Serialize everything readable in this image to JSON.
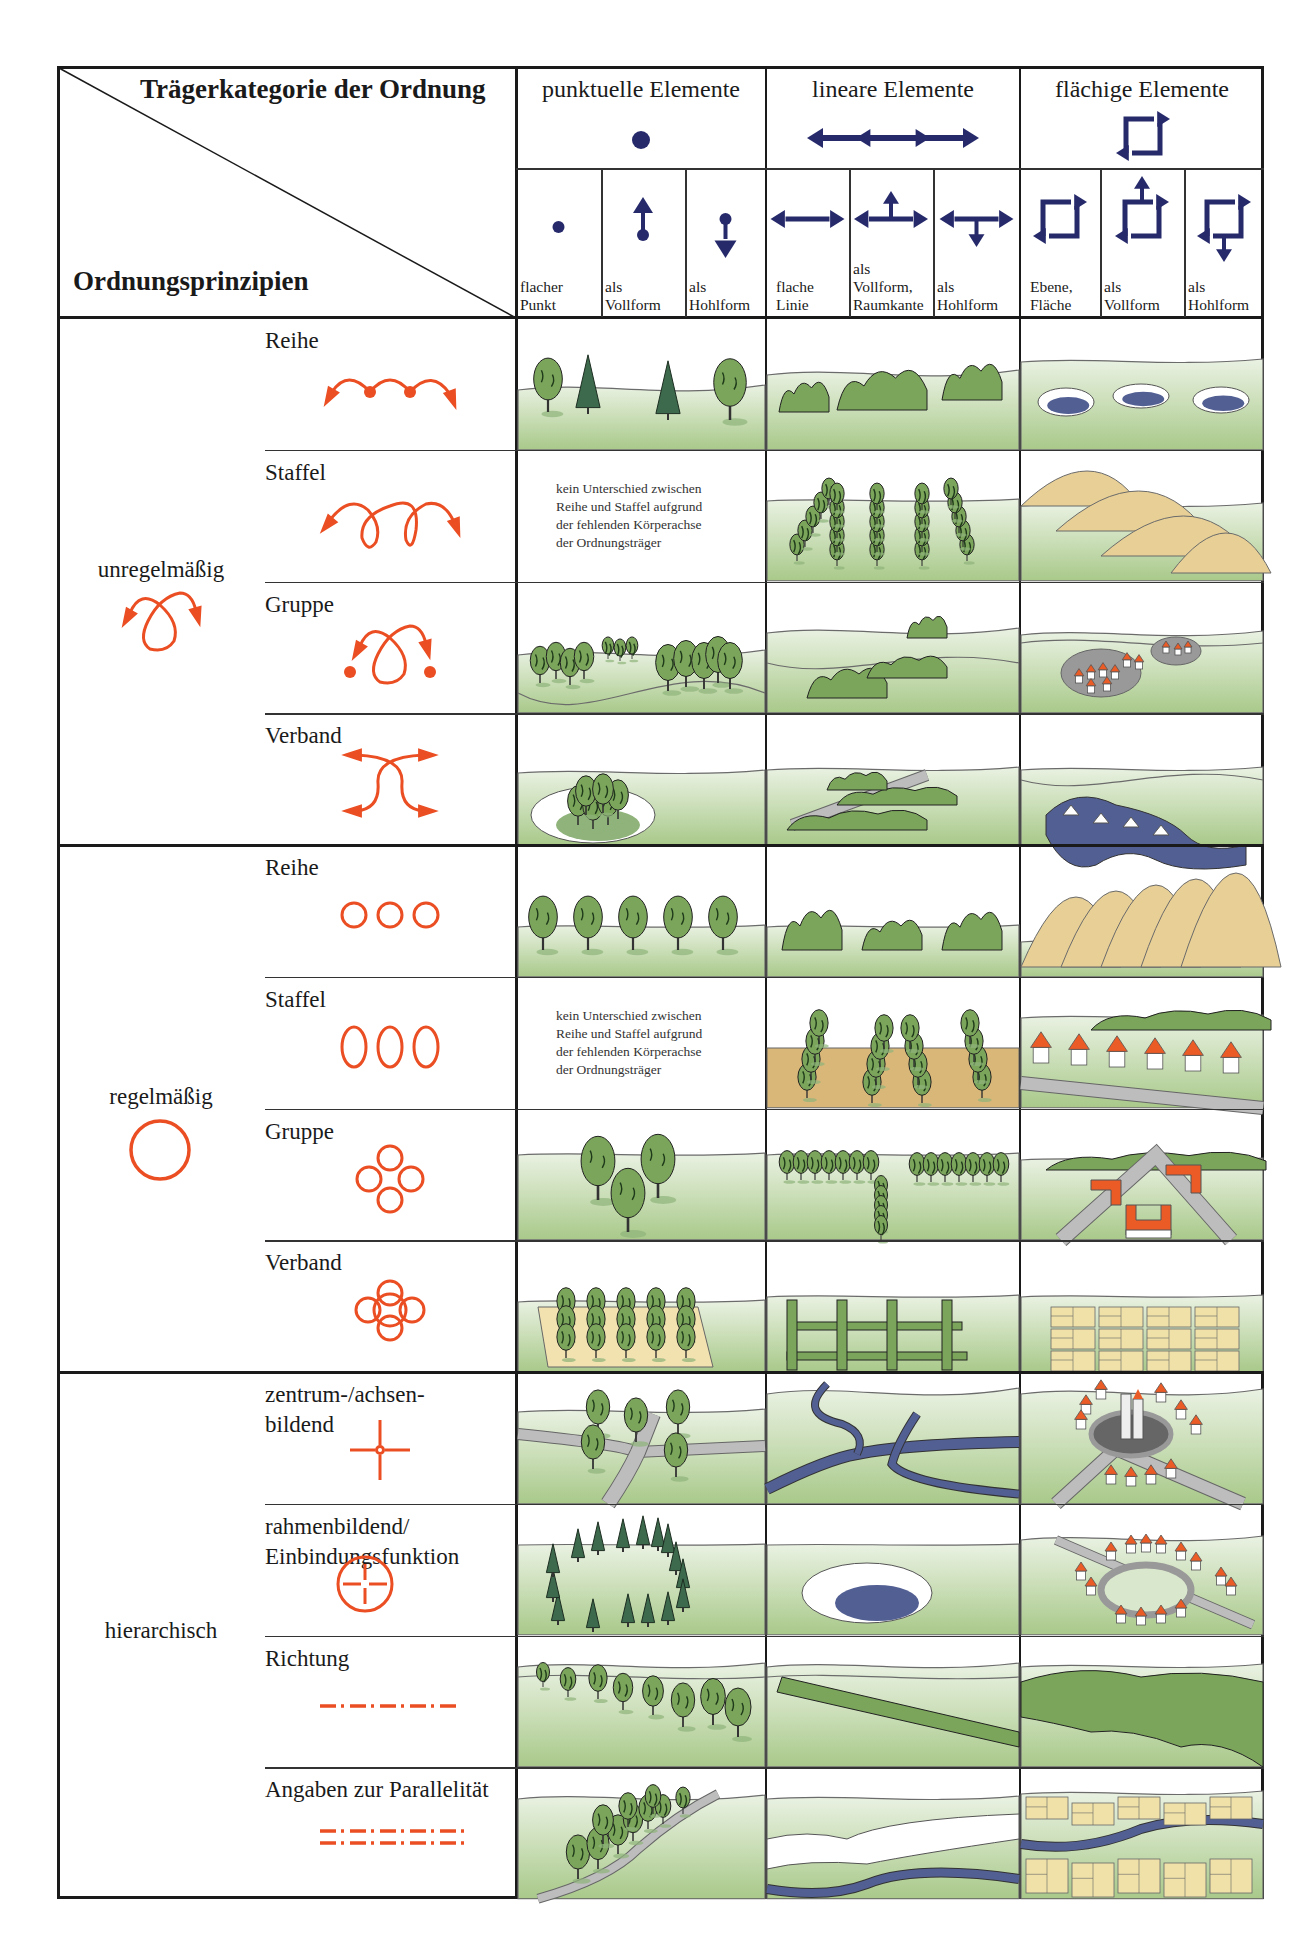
{
  "colors": {
    "navy": "#262a6b",
    "orange": "#ea4e22",
    "grass_light": "#eaf2e3",
    "grass_dark": "#a9c98a",
    "tree": "#7aa55a",
    "conifer": "#3d6a4c",
    "water": "#525f93",
    "sand": "#e7cf96",
    "roof": "#ea5b26",
    "road": "#9a9a9a"
  },
  "corner": {
    "top_label": "Trägerkategorie der Ordnung",
    "bottom_label": "Ordnungsprinzipien"
  },
  "categories": [
    {
      "title": "punktuelle Elemente",
      "icon": "dot-icon",
      "subcolumns": [
        {
          "label_lines": [
            "flacher",
            "Punkt"
          ],
          "icon": "flat-point-icon"
        },
        {
          "label_lines": [
            "als",
            "Vollform"
          ],
          "icon": "point-up-arrow-icon"
        },
        {
          "label_lines": [
            "als",
            "Hohlform"
          ],
          "icon": "point-down-arrow-icon"
        }
      ]
    },
    {
      "title": "lineare Elemente",
      "icon": "double-arrow-icon",
      "subcolumns": [
        {
          "label_lines": [
            "flache",
            "Linie"
          ],
          "icon": "double-arrow-icon"
        },
        {
          "label_lines": [
            "als",
            "Vollform,",
            "Raumkante"
          ],
          "icon": "double-arrow-up-icon"
        },
        {
          "label_lines": [
            "als",
            "Hohlform"
          ],
          "icon": "double-arrow-down-icon"
        }
      ]
    },
    {
      "title": "flächige Elemente",
      "icon": "square-arrows-icon",
      "subcolumns": [
        {
          "label_lines": [
            "Ebene,",
            "Fläche"
          ],
          "icon": "square-arrows-icon"
        },
        {
          "label_lines": [
            "als",
            "Vollform"
          ],
          "icon": "square-arrows-up-icon"
        },
        {
          "label_lines": [
            "als",
            "Hohlform"
          ],
          "icon": "square-arrows-down-icon"
        }
      ]
    }
  ],
  "note_text": [
    "kein Unterschied zwischen",
    "Reihe und Staffel aufgrund",
    "der fehlenden Körperachse",
    "der Ordnungsträger"
  ],
  "groups": [
    {
      "label": "unregelmäßig",
      "icon": "loop-arrows-icon",
      "rows": [
        {
          "label_lines": [
            "Reihe"
          ],
          "icon": "irregular-row-icon",
          "cells": [
            "trees-row-mixed",
            "shrubs-clusters",
            "hollows-row"
          ]
        },
        {
          "label_lines": [
            "Staffel"
          ],
          "icon": "irregular-staggered-icon",
          "cells": [
            "note",
            "tree-lines-staggered",
            "sand-dunes-staggered"
          ]
        },
        {
          "label_lines": [
            "Gruppe"
          ],
          "icon": "irregular-group-icon",
          "cells": [
            "tree-groups",
            "hedge-groups",
            "village-clusters"
          ]
        },
        {
          "label_lines": [
            "Verband"
          ],
          "icon": "irregular-network-icon",
          "cells": [
            "tree-clump-in-hollow",
            "hedge-network",
            "lake-with-islands"
          ]
        }
      ]
    },
    {
      "label": "regelmäßig",
      "icon": "circle-icon",
      "rows": [
        {
          "label_lines": [
            "Reihe"
          ],
          "icon": "three-circles-icon",
          "cells": [
            "trees-row-regular",
            "shrubs-regular",
            "hills-regular"
          ]
        },
        {
          "label_lines": [
            "Staffel"
          ],
          "icon": "three-ovals-icon",
          "cells": [
            "note",
            "poplar-rows-on-field",
            "houses-row"
          ]
        },
        {
          "label_lines": [
            "Gruppe"
          ],
          "icon": "four-circles-icon",
          "cells": [
            "three-trees-group",
            "tree-rows-T",
            "courtyard-buildings"
          ]
        },
        {
          "label_lines": [
            "Verband"
          ],
          "icon": "interlocked-circles-icon",
          "cells": [
            "orchard-grid",
            "hedge-grid",
            "field-grid"
          ]
        }
      ]
    },
    {
      "label": "hierarchisch",
      "icon": "",
      "rows": [
        {
          "label_lines": [
            "zentrum-/achsen-",
            "bildend"
          ],
          "icon": "crosshair-icon",
          "cells": [
            "trees-at-crossroads",
            "river-confluence",
            "village-central-tower"
          ]
        },
        {
          "label_lines": [
            "rahmenbildend/",
            "Einbindungsfunktion"
          ],
          "icon": "circled-cross-icon",
          "cells": [
            "conifer-ring",
            "lake-in-hollow",
            "village-ring-road"
          ]
        },
        {
          "label_lines": [
            "Richtung"
          ],
          "icon": "dash-dot-line-icon",
          "cells": [
            "trees-diagonal",
            "hedge-diagonal",
            "forest-edge"
          ]
        },
        {
          "label_lines": [
            "Angaben zur Parallelität"
          ],
          "icon": "double-dash-dot-line-icon",
          "cells": [
            "avenue-along-road",
            "terrace-along-river",
            "fields-along-river"
          ]
        }
      ]
    }
  ]
}
